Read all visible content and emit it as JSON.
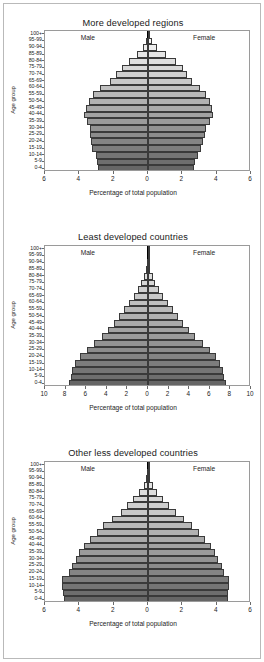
{
  "figure": {
    "axis_x_title": "Percentage of total population",
    "axis_y_title": "Age group",
    "male_label": "Male",
    "female_label": "Female",
    "age_groups": [
      "100+",
      "95-99",
      "90-94",
      "85-89",
      "80-84",
      "75-79",
      "70-74",
      "65-69",
      "60-64",
      "55-59",
      "50-54",
      "45-49",
      "40-44",
      "35-39",
      "30-34",
      "25-29",
      "20-24",
      "15-19",
      "10-14",
      "5-9",
      "0-4"
    ],
    "colors": {
      "frame": "#b9b9b9",
      "plot_border": "#9a9a9a",
      "center_line": "#000000",
      "bar_outline": "#3a3a3a",
      "text": "#1a1a1a"
    }
  },
  "chart_data": [
    {
      "type": "bar",
      "title": "More developed regions",
      "xlabel": "Percentage of total population",
      "ylabel": "Age group",
      "xlim": [
        -6,
        6
      ],
      "xticks": [
        -6,
        -4,
        -2,
        0,
        2,
        4,
        6
      ],
      "xticklabels": [
        "6",
        "4",
        "2",
        "0",
        "2",
        "4",
        "6"
      ],
      "categories": [
        "100+",
        "95-99",
        "90-94",
        "85-89",
        "80-84",
        "75-79",
        "70-74",
        "65-69",
        "60-64",
        "55-59",
        "50-54",
        "45-49",
        "40-44",
        "35-39",
        "30-34",
        "25-29",
        "20-24",
        "15-19",
        "10-14",
        "5-9",
        "0-4"
      ],
      "series": [
        {
          "name": "Male",
          "values": [
            0.02,
            0.1,
            0.3,
            0.65,
            1.1,
            1.5,
            1.85,
            2.2,
            2.8,
            3.2,
            3.45,
            3.6,
            3.75,
            3.55,
            3.4,
            3.35,
            3.3,
            3.25,
            3.05,
            2.95,
            2.9
          ]
        },
        {
          "name": "Female",
          "values": [
            0.05,
            0.22,
            0.55,
            1.05,
            1.65,
            2.05,
            2.3,
            2.55,
            3.05,
            3.4,
            3.6,
            3.7,
            3.8,
            3.6,
            3.4,
            3.3,
            3.2,
            3.1,
            2.9,
            2.75,
            2.7
          ]
        }
      ],
      "grid": false,
      "legend": "inline-top"
    },
    {
      "type": "bar",
      "title": "Least developed countries",
      "xlabel": "Percentage of total population",
      "ylabel": "Age group",
      "xlim": [
        -10,
        10
      ],
      "xticks": [
        -10,
        -8,
        -6,
        -4,
        -2,
        0,
        2,
        4,
        6,
        8,
        10
      ],
      "xticklabels": [
        "10",
        "8",
        "6",
        "4",
        "2",
        "0",
        "2",
        "4",
        "6",
        "8",
        "10"
      ],
      "categories": [
        "100+",
        "95-99",
        "90-94",
        "85-89",
        "80-84",
        "75-79",
        "70-74",
        "65-69",
        "60-64",
        "55-59",
        "50-54",
        "45-49",
        "40-44",
        "35-39",
        "30-34",
        "25-29",
        "20-24",
        "15-19",
        "10-14",
        "5-9",
        "0-4"
      ],
      "series": [
        {
          "name": "Male",
          "values": [
            0.01,
            0.03,
            0.08,
            0.2,
            0.4,
            0.65,
            1.0,
            1.4,
            1.85,
            2.3,
            2.8,
            3.3,
            3.9,
            4.5,
            5.2,
            5.9,
            6.6,
            7.1,
            7.4,
            7.5,
            7.7
          ]
        },
        {
          "name": "Female",
          "values": [
            0.01,
            0.04,
            0.1,
            0.24,
            0.45,
            0.72,
            1.1,
            1.5,
            1.95,
            2.4,
            2.9,
            3.4,
            4.0,
            4.6,
            5.3,
            6.0,
            6.6,
            7.0,
            7.3,
            7.4,
            7.6
          ]
        }
      ],
      "grid": false,
      "legend": "inline-top"
    },
    {
      "type": "bar",
      "title": "Other less developed countries",
      "xlabel": "Percentage of total population",
      "ylabel": "Age group",
      "xlim": [
        -6,
        6
      ],
      "xticks": [
        -6,
        -4,
        -2,
        0,
        2,
        4,
        6
      ],
      "xticklabels": [
        "6",
        "4",
        "2",
        "0",
        "2",
        "4",
        "6"
      ],
      "categories": [
        "100+",
        "95-99",
        "90-94",
        "85-89",
        "80-84",
        "75-79",
        "70-74",
        "65-69",
        "60-64",
        "55-59",
        "50-54",
        "45-49",
        "40-44",
        "35-39",
        "30-34",
        "25-29",
        "20-24",
        "15-19",
        "10-14",
        "5-9",
        "0-4"
      ],
      "series": [
        {
          "name": "Male",
          "values": [
            0.01,
            0.03,
            0.1,
            0.25,
            0.5,
            0.85,
            1.2,
            1.6,
            2.1,
            2.6,
            3.0,
            3.4,
            3.75,
            4.0,
            4.2,
            4.4,
            4.6,
            5.0,
            5.0,
            4.95,
            4.9
          ]
        },
        {
          "name": "Female",
          "values": [
            0.01,
            0.04,
            0.12,
            0.28,
            0.55,
            0.9,
            1.25,
            1.65,
            2.1,
            2.55,
            2.95,
            3.3,
            3.65,
            3.9,
            4.1,
            4.3,
            4.45,
            4.7,
            4.7,
            4.68,
            4.65
          ]
        }
      ],
      "grid": false,
      "legend": "inline-top"
    }
  ]
}
